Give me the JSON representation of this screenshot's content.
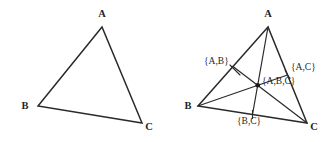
{
  "figure": {
    "background_color": "#ffffff",
    "stroke_color": "#2a2a2a",
    "text_color": "#1f1f1f",
    "panels": [
      {
        "id": "left",
        "name": "plain-triangle",
        "vertices": [
          {
            "key": "A",
            "label": "A",
            "x": 102,
            "y": 27,
            "label_x": 102,
            "label_y": 17
          },
          {
            "key": "B",
            "label": "B",
            "x": 38,
            "y": 106,
            "label_x": 25,
            "label_y": 109
          },
          {
            "key": "C",
            "label": "C",
            "x": 142,
            "y": 123,
            "label_x": 149,
            "label_y": 130
          }
        ],
        "edges": [
          {
            "from": "A",
            "to": "B"
          },
          {
            "from": "B",
            "to": "C"
          },
          {
            "from": "C",
            "to": "A"
          }
        ],
        "medians": [],
        "set_labels": [],
        "centroid": null
      },
      {
        "id": "right",
        "name": "triangle-with-median-lattice",
        "vertices": [
          {
            "key": "A",
            "label": "A",
            "x": 268,
            "y": 27,
            "label_x": 268,
            "label_y": 17
          },
          {
            "key": "B",
            "label": "B",
            "x": 198,
            "y": 106,
            "label_x": 188,
            "label_y": 109
          },
          {
            "key": "C",
            "label": "C",
            "x": 307,
            "y": 123,
            "label_x": 314,
            "label_y": 130
          }
        ],
        "edges": [
          {
            "from": "A",
            "to": "B"
          },
          {
            "from": "B",
            "to": "C"
          },
          {
            "from": "C",
            "to": "A"
          }
        ],
        "medians": [
          {
            "from": "A",
            "to_midpoint_of": "B,C",
            "mx": 252.5,
            "my": 114.5
          },
          {
            "from": "B",
            "to_midpoint_of": "A,C",
            "mx": 287.5,
            "my": 75.0
          },
          {
            "from": "C",
            "to_midpoint_of": "A,B",
            "mx": 233.0,
            "my": 66.5
          }
        ],
        "centroid": {
          "x": 257.7,
          "y": 85.3,
          "label": "{A,B,C}",
          "label_x": 262,
          "label_y": 84
        },
        "set_labels": [
          {
            "text": "{A,B}",
            "x": 204,
            "y": 64,
            "anchor": "start",
            "leader": {
              "x1": 232,
              "y1": 66,
              "x2": 239,
              "y2": 74
            }
          },
          {
            "text": "{A,C}",
            "x": 291,
            "y": 70,
            "anchor": "start",
            "leader": {
              "x1": 286,
              "y1": 70,
              "x2": 289,
              "y2": 76
            }
          },
          {
            "text": "{B,C}",
            "x": 237,
            "y": 124,
            "anchor": "start",
            "leader": {
              "x1": 252,
              "y1": 110,
              "x2": 252,
              "y2": 118
            }
          },
          {
            "text": "{A,B,C}",
            "x": 262,
            "y": 84,
            "anchor": "start",
            "leader": null
          }
        ]
      }
    ]
  }
}
